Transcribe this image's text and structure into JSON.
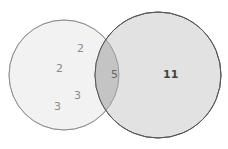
{
  "diagram": {
    "type": "venn",
    "sets": [
      {
        "name": "left-set",
        "color": "#f2f2f2",
        "stroke": "#a8a8a8"
      },
      {
        "name": "right-set",
        "color": "#e2e2e2",
        "stroke": "#555555"
      }
    ],
    "intersection_color": "#c4c4c4",
    "left_values": [
      "2",
      "2",
      "3",
      "3"
    ],
    "intersection_value": "5",
    "right_value": "11"
  }
}
